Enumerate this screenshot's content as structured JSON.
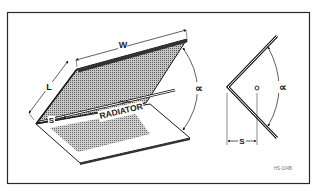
{
  "figure": {
    "id_label": "HS-104B",
    "colors": {
      "line": "#1a1a1a",
      "frame": "#2a2a2a",
      "mesh_fill": "#9a9a9a",
      "background": "#ffffff"
    }
  },
  "perspective_view": {
    "labels": {
      "width": "W",
      "length": "L",
      "spacing": "S",
      "radiator": "RADIATOR",
      "angle": "∝"
    }
  },
  "side_view": {
    "labels": {
      "angle": "∝",
      "spacing": "S",
      "radiator_marker": "o"
    }
  }
}
